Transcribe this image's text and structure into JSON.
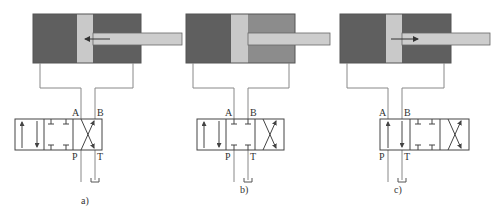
{
  "colors": {
    "dark_chamber": "#5f5f5f",
    "medium_chamber": "#8c8c8c",
    "piston": "#c9c9c9",
    "rod": "#cdcdcd",
    "line": "#777777",
    "valve_line": "#444444"
  },
  "ports": {
    "A": "A",
    "B": "B",
    "P": "P",
    "T": "T"
  },
  "panels": [
    {
      "caption": "a)",
      "state": "retracting",
      "cylinder": {
        "x": 33,
        "piston_x": 77,
        "right_chamber": "dark",
        "rod_arrow": "left"
      },
      "valve": {
        "x": 15,
        "active_cell": "right-crossed"
      }
    },
    {
      "caption": "b)",
      "state": "neutral-blocked",
      "cylinder": {
        "x": 186,
        "piston_x": 231,
        "right_chamber": "medium",
        "rod_arrow": "none"
      },
      "valve": {
        "x": 197,
        "active_cell": "center-blocked"
      }
    },
    {
      "caption": "c)",
      "state": "extending",
      "cylinder": {
        "x": 340,
        "piston_x": 386,
        "right_chamber": "dark",
        "rod_arrow": "right"
      },
      "valve": {
        "x": 380,
        "active_cell": "left-parallel"
      }
    }
  ]
}
